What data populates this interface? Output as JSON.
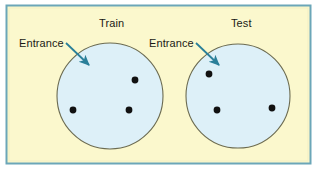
{
  "figure": {
    "width": 317,
    "height": 170,
    "background_color": "#ffffff",
    "panel_fill": "#fbf8cd",
    "panel_border_color": "#6ba6b8",
    "circle_fill": "#ddf0f8",
    "circle_stroke": "#6b6b52",
    "arrow_color": "#2a7f99",
    "dot_color": "#111111",
    "text_color": "#1a1a16"
  },
  "panels": [
    {
      "id": "train",
      "title": "Train",
      "entrance_label": "Entrance",
      "circle": {
        "cx": 110,
        "cy": 96,
        "r": 53
      },
      "arrow": {
        "x1": 66,
        "y1": 43,
        "x2": 89,
        "y2": 65
      },
      "dots": [
        {
          "x": 135,
          "y": 80
        },
        {
          "x": 73,
          "y": 110
        },
        {
          "x": 129,
          "y": 110
        }
      ]
    },
    {
      "id": "test",
      "title": "Test",
      "entrance_label": "Entrance",
      "circle": {
        "cx": 238,
        "cy": 96,
        "r": 52
      },
      "arrow": {
        "x1": 196,
        "y1": 43,
        "x2": 219,
        "y2": 65
      },
      "dots": [
        {
          "x": 209,
          "y": 74
        },
        {
          "x": 217,
          "y": 110
        },
        {
          "x": 272,
          "y": 108
        }
      ]
    }
  ],
  "frame": {
    "x": 6,
    "y": 5,
    "width": 305,
    "height": 159
  }
}
